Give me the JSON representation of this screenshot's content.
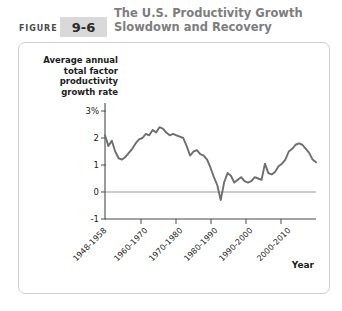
{
  "header": {
    "figure_label": "FIGURE",
    "figure_number": "9-6",
    "title_line1": "The U.S. Productivity Growth",
    "title_line2": "Slowdown and Recovery",
    "badge_color": "#d9d9d9",
    "title_color": "#7d7d7d"
  },
  "source_note": "Source: Bureau of Labor Statistics.",
  "chart_data": {
    "type": "line",
    "title": "The U.S. Productivity Growth Slowdown and Recovery",
    "xlabel": "Year",
    "ylabel": "Average annual total factor productivity growth rate",
    "ylabel_lines": [
      "Average annual",
      "total factor",
      "productivity",
      "growth rate"
    ],
    "ytick_labels": [
      "3%",
      "2",
      "1",
      "0",
      "-1"
    ],
    "ytick_values": [
      3,
      2,
      1,
      0,
      -1
    ],
    "ylim": [
      -1,
      3.4
    ],
    "xtick_labels": [
      "1948-1958",
      "1960-1970",
      "1970-1980",
      "1980-1990",
      "1990-2000",
      "2000-2010"
    ],
    "xtick_values": [
      1953,
      1965,
      1975,
      1985,
      1995,
      2005
    ],
    "xlim": [
      1948,
      2010
    ],
    "grid": false,
    "legend": null,
    "zero_line": 0,
    "line_color": "#6e6e6e",
    "series": [
      {
        "name": "Average annual total factor productivity growth rate",
        "x": [
          1948,
          1949,
          1950,
          1951,
          1952,
          1953,
          1954,
          1955,
          1956,
          1957,
          1958,
          1959,
          1960,
          1961,
          1962,
          1963,
          1964,
          1965,
          1966,
          1967,
          1968,
          1969,
          1970,
          1971,
          1972,
          1973,
          1974,
          1975,
          1976,
          1977,
          1978,
          1979,
          1980,
          1981,
          1982,
          1983,
          1984,
          1985,
          1986,
          1987,
          1988,
          1989,
          1990,
          1991,
          1992,
          1993,
          1994,
          1995,
          1996,
          1997,
          1998,
          1999,
          2000,
          2001,
          2002,
          2003,
          2004,
          2005,
          2006,
          2007,
          2008,
          2009,
          2010
        ],
        "values": [
          2.1,
          1.7,
          1.9,
          1.5,
          1.25,
          1.2,
          1.3,
          1.45,
          1.6,
          1.8,
          1.95,
          2.0,
          2.15,
          2.1,
          2.3,
          2.2,
          2.4,
          2.35,
          2.2,
          2.1,
          2.15,
          2.1,
          2.05,
          2.0,
          1.7,
          1.35,
          1.5,
          1.55,
          1.4,
          1.35,
          1.2,
          0.9,
          0.55,
          0.25,
          -0.3,
          0.35,
          0.7,
          0.6,
          0.35,
          0.45,
          0.55,
          0.4,
          0.35,
          0.4,
          0.55,
          0.5,
          0.45,
          1.05,
          0.7,
          0.65,
          0.75,
          0.95,
          1.05,
          1.2,
          1.5,
          1.6,
          1.75,
          1.8,
          1.75,
          1.6,
          1.45,
          1.2,
          1.1
        ]
      }
    ]
  }
}
